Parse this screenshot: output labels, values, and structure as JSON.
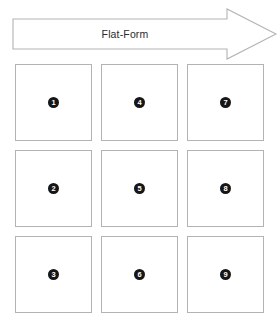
{
  "banner": {
    "label": "Flat-Form",
    "shape": "right-arrow",
    "outline_color": "#b3b3b3",
    "fill_color": "#ffffff",
    "text_color": "#2b2b2b"
  },
  "grid": {
    "rows": 3,
    "columns": 3,
    "box_border_color": "#b3b3b3",
    "box_fill_color": "#ffffff",
    "badge_fill_color": "#161616",
    "badge_text_color": "#ffffff",
    "cells": [
      {
        "badge": "1"
      },
      {
        "badge": "4"
      },
      {
        "badge": "7"
      },
      {
        "badge": "2"
      },
      {
        "badge": "5"
      },
      {
        "badge": "8"
      },
      {
        "badge": "3"
      },
      {
        "badge": "6"
      },
      {
        "badge": "9"
      }
    ]
  }
}
